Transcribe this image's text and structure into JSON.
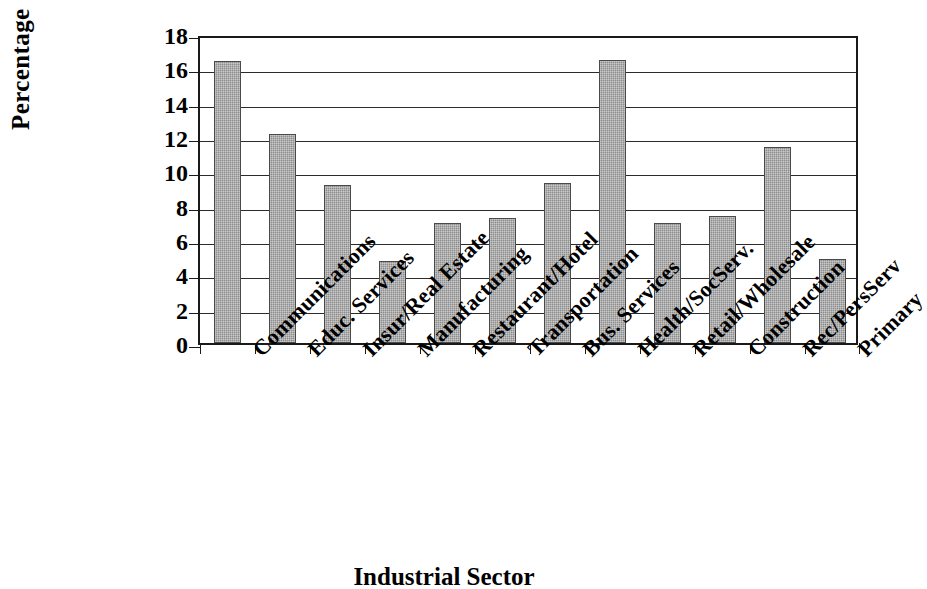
{
  "chart_data": {
    "type": "bar",
    "title": "",
    "xlabel": "Industrial Sector",
    "ylabel": "Percentage",
    "ylim": [
      0,
      18
    ],
    "ytick_step": 2,
    "yticks": [
      18,
      16,
      14,
      12,
      10,
      8,
      6,
      4,
      2,
      0
    ],
    "grid": true,
    "legend": "none",
    "bar_color": "#8d8d8d",
    "bar_edge_color": "#4a4a4a",
    "axis_color": "#1a1a1a",
    "categories": [
      "Communications",
      "Educ. Services",
      "Insur/Real Estate",
      "Manufacturing",
      "Restaurant/Hotel",
      "Transportation",
      "Bus. Services",
      "Health/SocServ.",
      "Retail/Wholesale",
      "Construction",
      "Rec/PersServ",
      "Primary"
    ],
    "values": [
      16.4,
      12.2,
      9.2,
      4.8,
      7.0,
      7.3,
      9.3,
      16.5,
      7.0,
      7.4,
      11.4,
      4.9
    ]
  }
}
